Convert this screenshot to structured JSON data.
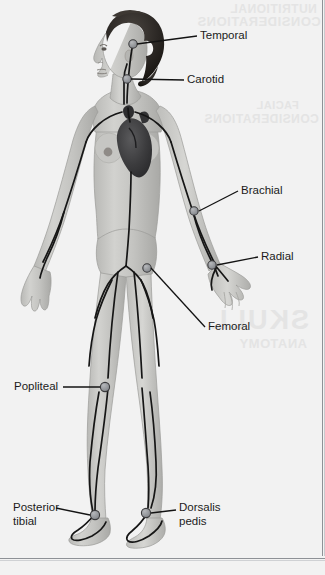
{
  "figure": {
    "view": "anterior",
    "background_color": "#f2f2f2",
    "artery_line_color": "#1a1a1a",
    "pulse_marker_color": "#8d9095",
    "skin_color": "#c9c9c7",
    "hair_color": "#2a2724",
    "heart_color": "#3a3a3c"
  },
  "labels": [
    {
      "id": "temporal",
      "text": "Temporal",
      "side": "right"
    },
    {
      "id": "carotid",
      "text": "Carotid",
      "side": "right"
    },
    {
      "id": "brachial",
      "text": "Brachial",
      "side": "right"
    },
    {
      "id": "radial",
      "text": "Radial",
      "side": "right"
    },
    {
      "id": "femoral",
      "text": "Femoral",
      "side": "right"
    },
    {
      "id": "popliteal",
      "text": "Popliteal",
      "side": "left"
    },
    {
      "id": "posterior-tibial",
      "text": "Posterior\ntibial",
      "side": "left"
    },
    {
      "id": "dorsalis-pedis",
      "text": "Dorsalis\n pedis",
      "side": "right"
    }
  ],
  "bleed_through": {
    "line1": "NUTRITIONAL",
    "line2": "CONSIDERATIONS",
    "line3": "FACIAL",
    "line4": "CONSIDERATIONS",
    "line5": "SKULL",
    "line6": "ANATOMY"
  }
}
